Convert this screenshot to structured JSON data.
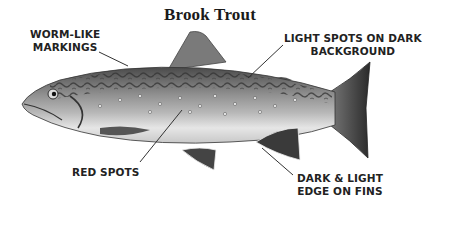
{
  "title": "Brook Trout",
  "labels": {
    "worm": [
      "WORM-LIKE",
      "MARKINGS"
    ],
    "light_spots": [
      "LIGHT SPOTS ON DARK",
      "BACKGROUND"
    ],
    "red_spots": [
      "RED SPOTS"
    ],
    "fins": [
      "DARK & LIGHT",
      "EDGE ON FINS"
    ]
  },
  "colors": {
    "background": "#ffffff",
    "text": "#222222",
    "fish_dark": "#3a3a3a",
    "fish_mid": "#9a9a9a",
    "fish_light": "#d8d8d8"
  }
}
